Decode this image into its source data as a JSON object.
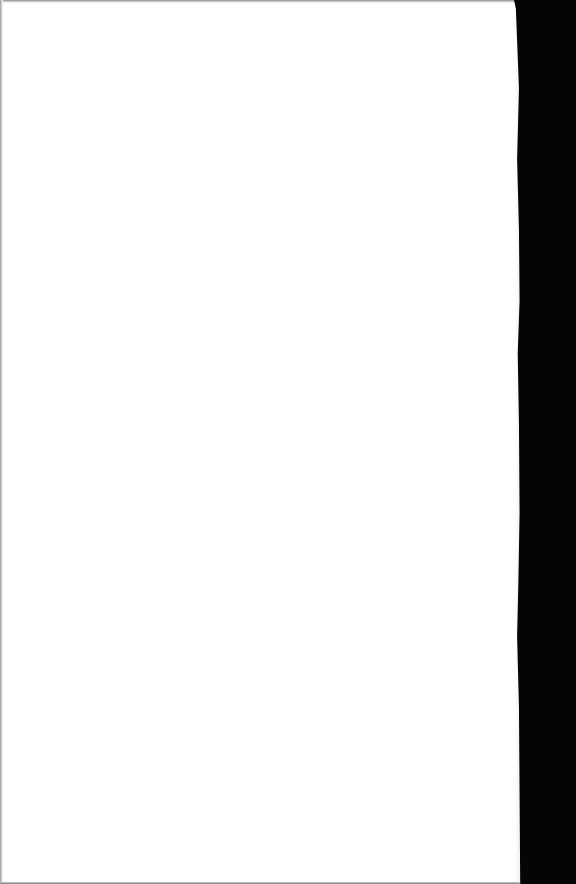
{
  "document": {
    "type": "scanned-page",
    "content": "",
    "colors": {
      "paper": "#ffffff",
      "binding": "#050505",
      "edge_shadow": "#8a8a8a"
    }
  }
}
